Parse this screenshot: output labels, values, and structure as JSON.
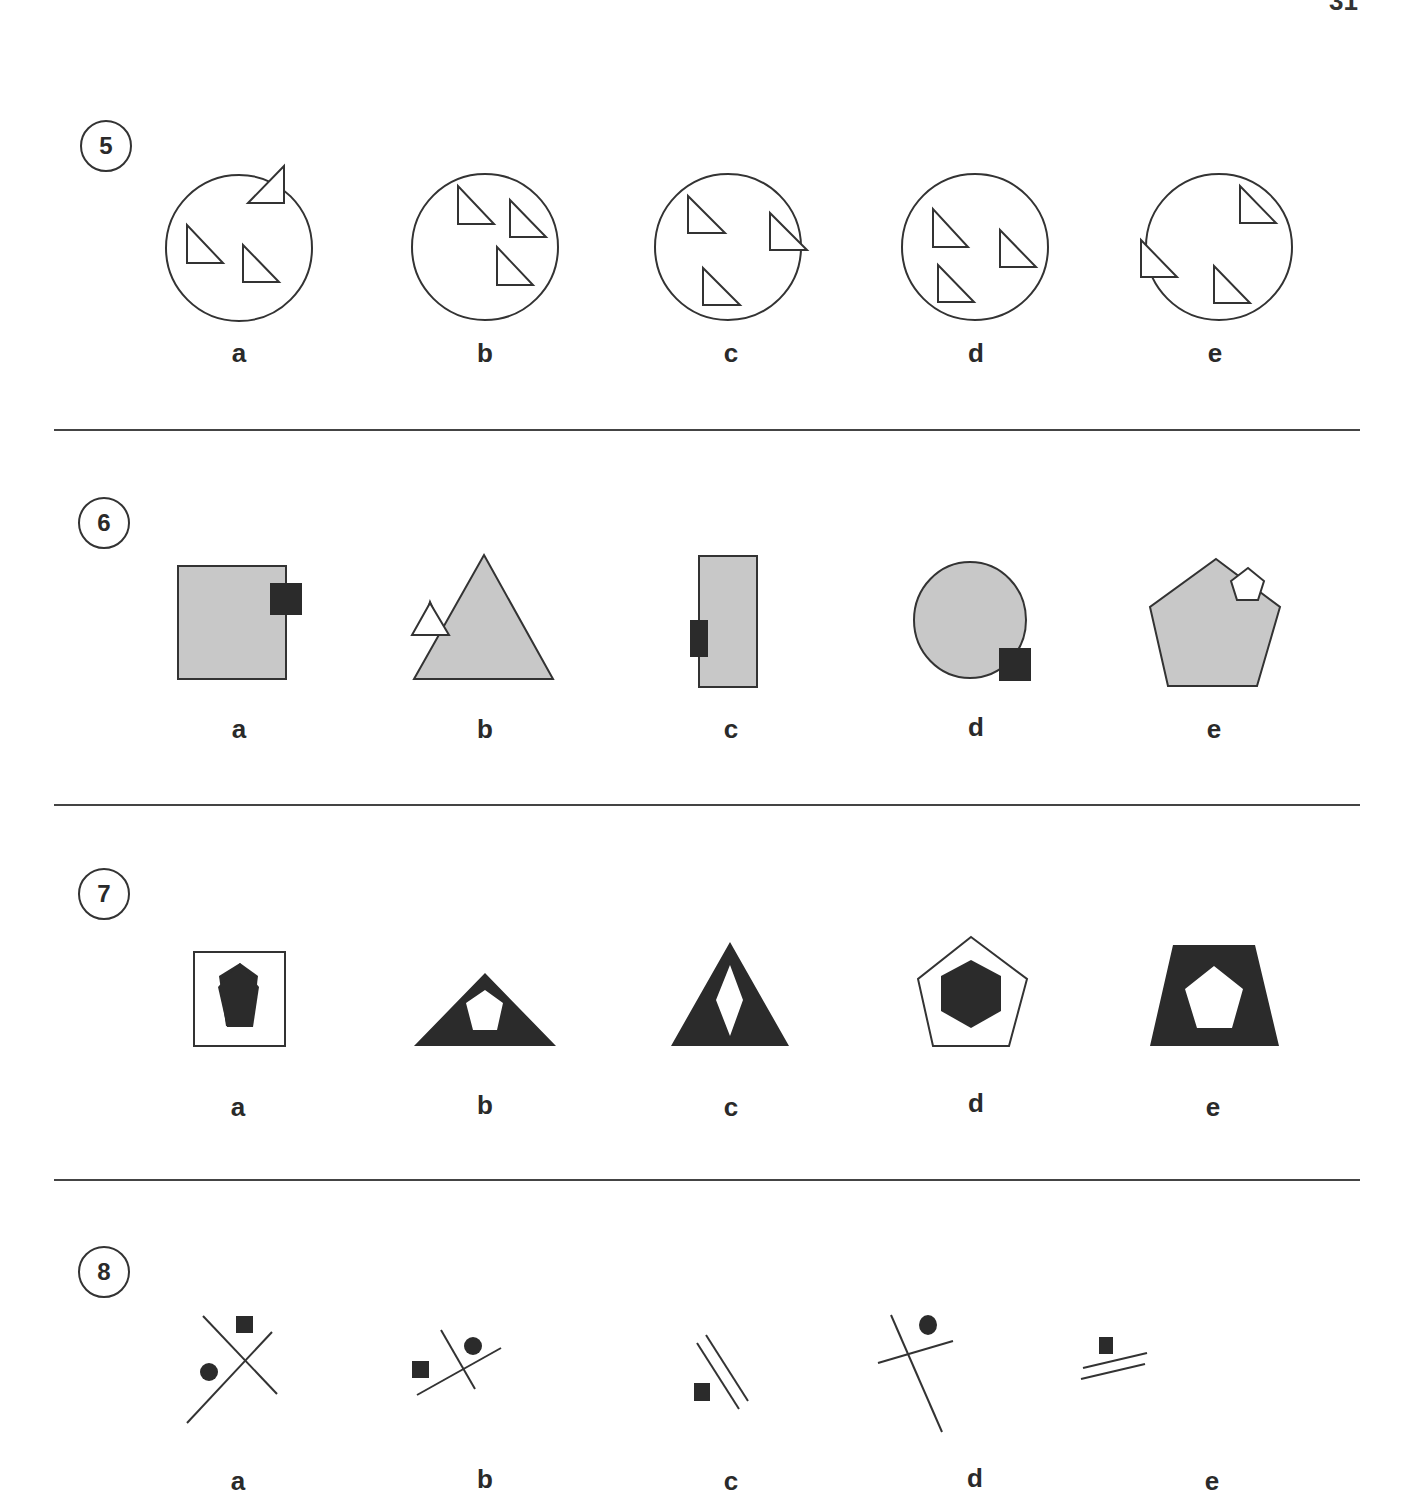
{
  "page": {
    "number": "31"
  },
  "questions": [
    {
      "number": "5",
      "options": [
        "a",
        "b",
        "c",
        "d",
        "e"
      ],
      "description": "Circles with three right triangles; one triangle may overlap the circle edge"
    },
    {
      "number": "6",
      "options": [
        "a",
        "b",
        "c",
        "d",
        "e"
      ],
      "description": "Grey shapes with a small shape overlapping the edge"
    },
    {
      "number": "7",
      "options": [
        "a",
        "b",
        "c",
        "d",
        "e"
      ],
      "description": "Shapes containing an inner shape with inverted fill"
    },
    {
      "number": "8",
      "options": [
        "a",
        "b",
        "c",
        "d",
        "e"
      ],
      "description": "Line arrangements with small black square/circle"
    }
  ],
  "colors": {
    "ink": "#2a2a2a",
    "grey_fill": "#c8c8c8",
    "dark_fill": "#2b2b2b",
    "divider": "#444444"
  }
}
